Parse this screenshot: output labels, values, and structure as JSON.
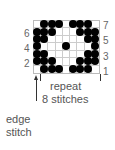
{
  "diagram": {
    "type": "knitting-chart",
    "rows": 7,
    "columns": 9,
    "grid": [
      [
        0,
        1,
        1,
        1,
        0,
        1,
        1,
        1,
        0
      ],
      [
        1,
        1,
        1,
        0,
        0,
        0,
        1,
        1,
        1
      ],
      [
        1,
        1,
        0,
        0,
        0,
        0,
        0,
        1,
        1
      ],
      [
        1,
        0,
        0,
        0,
        1,
        0,
        0,
        0,
        1
      ],
      [
        1,
        1,
        0,
        0,
        0,
        0,
        0,
        1,
        1
      ],
      [
        1,
        1,
        1,
        0,
        0,
        0,
        1,
        1,
        1
      ],
      [
        0,
        1,
        1,
        1,
        0,
        1,
        1,
        1,
        0
      ]
    ],
    "grid_row_order": "top-to-bottom (row 7 first, row 1 last)",
    "left_row_labels": [
      "6",
      "4",
      "2"
    ],
    "right_row_labels": [
      "7",
      "5",
      "3",
      "1"
    ],
    "repeat_label_line1": "repeat",
    "repeat_label_line2": "8 stitches",
    "edge_label_line1": "edge",
    "edge_label_line2": "stitch",
    "colors": {
      "filled": "#000000",
      "grid_line": "#cccccc",
      "text": "#555555"
    }
  }
}
